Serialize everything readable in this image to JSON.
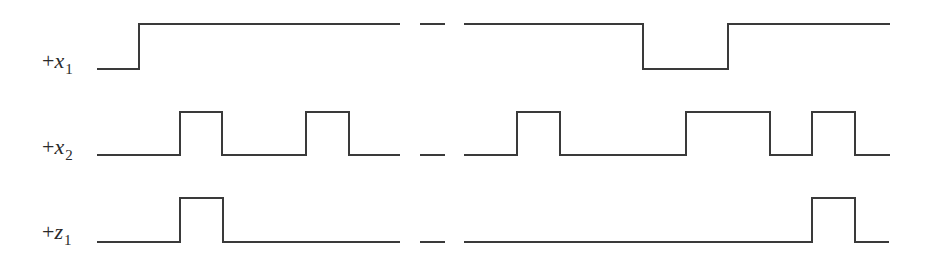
{
  "diagram": {
    "type": "timing-diagram",
    "line_color": "#3a3a3a",
    "signals": [
      {
        "id": "x1",
        "label": {
          "sign": "+",
          "var": "x",
          "sub": "1"
        },
        "label_pos": {
          "left": 42,
          "top": 50
        },
        "levels": {
          "high": 24,
          "low": 69
        },
        "left_segment": {
          "start": 97,
          "end": 400,
          "start_level": "low",
          "transitions": [
            139
          ]
        },
        "break_dashes": [
          [
            420,
            445
          ]
        ],
        "right_segment": {
          "start": 464,
          "end": 890,
          "start_level": "high",
          "transitions": [
            643,
            728
          ]
        }
      },
      {
        "id": "x2",
        "label": {
          "sign": "+",
          "var": "x",
          "sub": "2"
        },
        "label_pos": {
          "left": 42,
          "top": 136
        },
        "levels": {
          "high": 112,
          "low": 155
        },
        "left_segment": {
          "start": 97,
          "end": 400,
          "start_level": "low",
          "transitions": [
            180,
            222,
            306,
            349
          ]
        },
        "break_dashes": [
          [
            420,
            445
          ]
        ],
        "right_segment": {
          "start": 464,
          "end": 890,
          "start_level": "low",
          "transitions": [
            517,
            560,
            686,
            770,
            812,
            855
          ]
        }
      },
      {
        "id": "z1",
        "label": {
          "sign": "+",
          "var": "z",
          "sub": "1"
        },
        "label_pos": {
          "left": 42,
          "top": 221
        },
        "levels": {
          "high": 198,
          "low": 242
        },
        "left_segment": {
          "start": 97,
          "end": 400,
          "start_level": "low",
          "transitions": [
            180,
            223
          ]
        },
        "break_dashes": [
          [
            420,
            445
          ]
        ],
        "right_segment": {
          "start": 464,
          "end": 889,
          "start_level": "low",
          "transitions": [
            812,
            855
          ]
        }
      }
    ]
  }
}
